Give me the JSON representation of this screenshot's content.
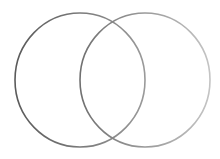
{
  "diagram": {
    "type": "venn",
    "sets": [
      {
        "name": "left-circle",
        "cx": 80,
        "cy": 80,
        "rx": 65,
        "ry": 67,
        "stroke": "#6e6e6e"
      },
      {
        "name": "right-circle",
        "cx": 145,
        "cy": 80,
        "rx": 65,
        "ry": 67,
        "stroke": "#a8a8a8"
      }
    ],
    "background": "#ffffff"
  }
}
